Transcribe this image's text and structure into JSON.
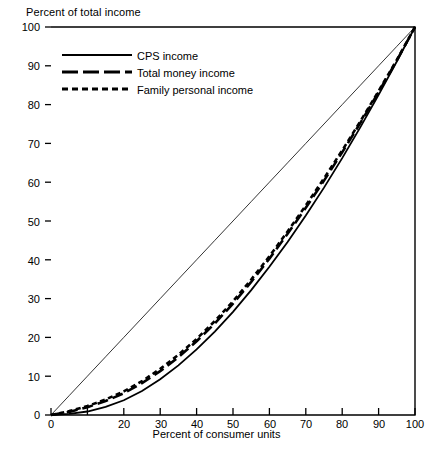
{
  "chart_data": {
    "type": "line",
    "title": "",
    "xlabel": "Percent of consumer units",
    "ylabel": "Percent of total income",
    "xlim": [
      0,
      100
    ],
    "ylim": [
      0,
      100
    ],
    "grid": false,
    "legend_position": "top-left inside plot",
    "xticks": [
      0,
      10,
      20,
      30,
      40,
      50,
      60,
      70,
      80,
      90,
      100
    ],
    "xtick_labels": [
      "0",
      "",
      "20",
      "30",
      "40",
      "50",
      "60",
      "70",
      "80",
      "90",
      "100"
    ],
    "yticks": [
      0,
      10,
      20,
      30,
      40,
      50,
      60,
      70,
      80,
      90,
      100
    ],
    "ytick_labels": [
      "0",
      "10",
      "20",
      "30",
      "40",
      "50",
      "60",
      "70",
      "80",
      "90",
      "100"
    ],
    "x": [
      0,
      5,
      10,
      15,
      20,
      25,
      30,
      35,
      40,
      45,
      50,
      55,
      60,
      65,
      70,
      75,
      80,
      85,
      90,
      95,
      100
    ],
    "series": [
      {
        "name": "CPS income",
        "style": "solid",
        "color": "#000000",
        "values": [
          0,
          0.3,
          0.9,
          2.1,
          3.8,
          6.2,
          9.2,
          12.8,
          16.9,
          21.5,
          26.6,
          32.2,
          38.2,
          44.6,
          51.4,
          58.6,
          66.2,
          74.2,
          82.5,
          91.1,
          100
        ]
      },
      {
        "name": "Total money income",
        "style": "long-dash",
        "color": "#000000",
        "values": [
          0,
          0.8,
          2.0,
          3.6,
          5.6,
          8.2,
          11.3,
          14.9,
          19.0,
          23.6,
          28.7,
          34.3,
          40.3,
          46.7,
          53.4,
          60.4,
          67.7,
          75.3,
          83.2,
          91.4,
          100
        ]
      },
      {
        "name": "Family personal income",
        "style": "short-dash",
        "color": "#000000",
        "values": [
          0,
          1.0,
          2.3,
          4.0,
          6.1,
          8.7,
          11.9,
          15.5,
          19.6,
          24.2,
          29.3,
          34.9,
          40.9,
          47.3,
          54.0,
          61.0,
          68.2,
          75.7,
          83.5,
          91.5,
          100
        ]
      },
      {
        "name": "line of equality",
        "style": "thin-solid-reference",
        "color": "#000000",
        "values": [
          0,
          5,
          10,
          15,
          20,
          25,
          30,
          35,
          40,
          45,
          50,
          55,
          60,
          65,
          70,
          75,
          80,
          85,
          90,
          95,
          100
        ]
      }
    ]
  },
  "legend": {
    "items": [
      {
        "label": "CPS income"
      },
      {
        "label": "Total money income"
      },
      {
        "label": "Family personal income"
      }
    ]
  }
}
